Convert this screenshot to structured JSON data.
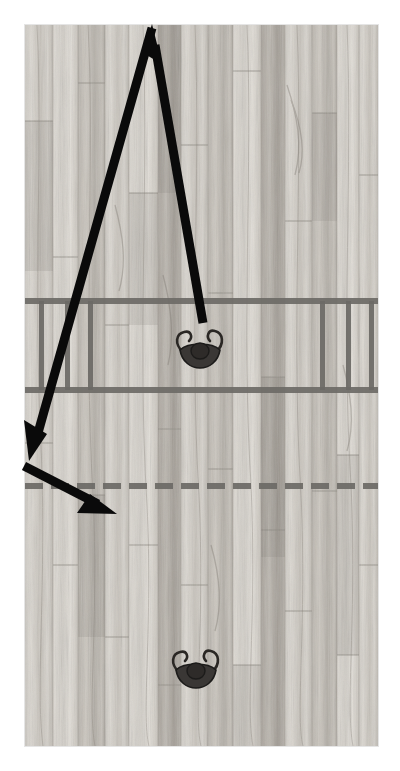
{
  "scene": {
    "title": "Basketball half-court play diagram",
    "surface": "hardwood-basketball-court",
    "view": "overhead",
    "canvas_width": 400,
    "canvas_height": 771,
    "photo_rect": {
      "x": 25,
      "y": 25,
      "width": 353,
      "height": 721
    }
  },
  "colors": {
    "wood_light": "#d6d2cb",
    "wood_mid": "#bfbab2",
    "wood_dark": "#a39d94",
    "wood_grain": "#8d8881",
    "court_line": "#6c6a66",
    "play_line": "#0a0a0a",
    "player_fill": "#3a3735",
    "player_outline": "#1c1b1a",
    "background": "#ffffff"
  },
  "court_markings": [
    {
      "name": "free-throw-line-upper",
      "style": "solid",
      "y": 301,
      "thickness": 6,
      "x_start": 25,
      "x_end": 378
    },
    {
      "name": "free-throw-line-lower",
      "style": "solid",
      "y": 390,
      "thickness": 6,
      "x_start": 25,
      "x_end": 378
    },
    {
      "name": "three-point-dashed-line",
      "style": "dashed",
      "y": 484,
      "thickness": 6,
      "x_start": 25,
      "x_end": 378,
      "dash": 18,
      "gap": 8
    },
    {
      "name": "lane-hash-left-1",
      "style": "vertical",
      "x": 41,
      "y_start": 301,
      "y_end": 390,
      "thickness": 5
    },
    {
      "name": "lane-hash-left-2",
      "style": "vertical",
      "x": 67,
      "y_start": 301,
      "y_end": 390,
      "thickness": 5
    },
    {
      "name": "lane-hash-left-3",
      "style": "vertical",
      "x": 90,
      "y_start": 301,
      "y_end": 390,
      "thickness": 5
    },
    {
      "name": "lane-hash-right-1",
      "style": "vertical",
      "x": 322,
      "y_start": 301,
      "y_end": 390,
      "thickness": 5
    },
    {
      "name": "lane-hash-right-2",
      "style": "vertical",
      "x": 348,
      "y_start": 301,
      "y_end": 390,
      "thickness": 5
    },
    {
      "name": "lane-hash-right-3",
      "style": "vertical",
      "x": 371,
      "y_start": 301,
      "y_end": 390,
      "thickness": 5
    }
  ],
  "players": [
    {
      "id": "player-upper",
      "label": "Player at free-throw area",
      "x": 200,
      "y": 350,
      "orientation": "overhead",
      "arms": "raised"
    },
    {
      "id": "player-lower",
      "label": "Player near baseline",
      "x": 196,
      "y": 670,
      "orientation": "overhead",
      "arms": "raised"
    }
  ],
  "play_arrows": [
    {
      "id": "arrow-up-right-leg",
      "label": "Movement from player up to top of court",
      "points": [
        [
          203,
          323
        ],
        [
          152,
          28
        ]
      ],
      "arrowhead": "end",
      "stroke_width": 9
    },
    {
      "id": "arrow-down-left-leg",
      "label": "Movement from top of court down to left wing",
      "points": [
        [
          152,
          28
        ],
        [
          31,
          459
        ]
      ],
      "arrowhead": "end",
      "stroke_width": 9
    },
    {
      "id": "arrow-cut-to-corner",
      "label": "Cut from left wing toward baseline corner",
      "points": [
        [
          24,
          466
        ],
        [
          115,
          513
        ]
      ],
      "arrowhead": "end",
      "stroke_width": 9
    }
  ]
}
